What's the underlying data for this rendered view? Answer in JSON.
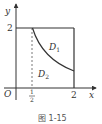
{
  "figure": {
    "caption": "图 1-15",
    "axes": {
      "x_label": "x",
      "y_label": "y",
      "origin_label": "O",
      "x_ticks": [
        "1/2",
        "2"
      ],
      "y_ticks": [
        "2"
      ]
    },
    "regions": {
      "d1": "D",
      "d1_sub": "1",
      "d2": "D",
      "d2_sub": "2"
    },
    "fraction": {
      "numerator": "1",
      "denominator": "2"
    },
    "tick_x2": "2",
    "tick_y2": "2",
    "curve": "y = 1/x from x=1/2 to x=2",
    "colors": {
      "line": "#333333",
      "dashed": "#555555"
    }
  }
}
